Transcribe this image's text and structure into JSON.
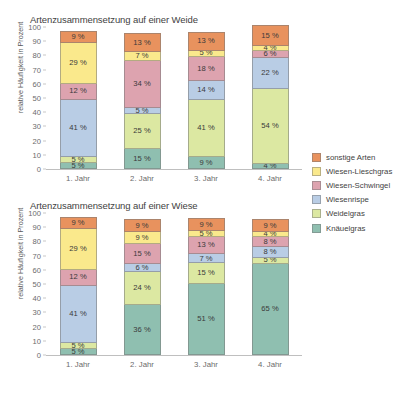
{
  "legend": {
    "position": "right",
    "items": [
      {
        "label": "sonstige Arten",
        "color": "#E8925E"
      },
      {
        "label": "Wiesen-Lieschgras",
        "color": "#FAE98C"
      },
      {
        "label": "Wiesen-Schwingel",
        "color": "#DDA3AF"
      },
      {
        "label": "Wiesenrispe",
        "color": "#B9CDE5"
      },
      {
        "label": "Weidelgras",
        "color": "#DCE8A2"
      },
      {
        "label": "Knäuelgras",
        "color": "#8FBFB0"
      }
    ]
  },
  "axis": {
    "ylabel": "relative Häufigkeit in Prozent",
    "yticks": [
      0,
      10,
      20,
      30,
      40,
      50,
      60,
      70,
      80,
      90,
      100
    ],
    "ylim": [
      0,
      100
    ],
    "categories": [
      "1. Jahr",
      "2. Jahr",
      "3. Jahr",
      "4. Jahr"
    ]
  },
  "chart_data": [
    {
      "type": "bar",
      "stacked": true,
      "title": "Artenzusammensetzung auf einer Weide",
      "xlabel": "",
      "ylabel": "relative Häufigkeit in Prozent",
      "ylim": [
        0,
        100
      ],
      "grid": false,
      "legend_position": "right",
      "categories": [
        "1. Jahr",
        "2. Jahr",
        "3. Jahr",
        "4. Jahr"
      ],
      "series": [
        {
          "name": "Knäuelgras",
          "color": "#8FBFB0",
          "values": [
            5,
            15,
            9,
            4
          ],
          "labels": [
            "5 %",
            "15 %",
            "9 %",
            "4 %"
          ]
        },
        {
          "name": "Weidelgras",
          "color": "#DCE8A2",
          "values": [
            5,
            25,
            41,
            54
          ],
          "labels": [
            "5 %",
            "25 %",
            "41 %",
            "54 %"
          ]
        },
        {
          "name": "Wiesenrispe",
          "color": "#B9CDE5",
          "values": [
            41,
            5,
            14,
            22
          ],
          "labels": [
            "41 %",
            "5 %",
            "14 %",
            "22 %"
          ]
        },
        {
          "name": "Wiesen-Schwingel",
          "color": "#DDA3AF",
          "values": [
            12,
            34,
            18,
            6
          ],
          "labels": [
            "12 %",
            "34 %",
            "18 %",
            "6 %"
          ]
        },
        {
          "name": "Wiesen-Lieschgras",
          "color": "#FAE98C",
          "values": [
            29,
            7,
            5,
            4
          ],
          "labels": [
            "29 %",
            "7 %",
            "5 %",
            "4 %"
          ]
        },
        {
          "name": "sonstige Arten",
          "color": "#E8925E",
          "values": [
            9,
            13,
            13,
            15
          ],
          "labels": [
            "9 %",
            "13 %",
            "13 %",
            "15 %"
          ]
        }
      ]
    },
    {
      "type": "bar",
      "stacked": true,
      "title": "Artenzusammensetzung auf einer Wiese",
      "xlabel": "",
      "ylabel": "relative Häufigkeit in Prozent",
      "ylim": [
        0,
        100
      ],
      "grid": false,
      "legend_position": "right",
      "categories": [
        "1. Jahr",
        "2. Jahr",
        "3. Jahr",
        "4. Jahr"
      ],
      "series": [
        {
          "name": "Knäuelgras",
          "color": "#8FBFB0",
          "values": [
            5,
            36,
            51,
            65
          ],
          "labels": [
            "5 %",
            "36 %",
            "51 %",
            "65 %"
          ]
        },
        {
          "name": "Weidelgras",
          "color": "#DCE8A2",
          "values": [
            5,
            24,
            15,
            5
          ],
          "labels": [
            "5 %",
            "24 %",
            "15 %",
            "5 %"
          ]
        },
        {
          "name": "Wiesenrispe",
          "color": "#B9CDE5",
          "values": [
            41,
            6,
            7,
            8
          ],
          "labels": [
            "41 %",
            "6 %",
            "7 %",
            "8 %"
          ]
        },
        {
          "name": "Wiesen-Schwingel",
          "color": "#DDA3AF",
          "values": [
            12,
            15,
            13,
            8
          ],
          "labels": [
            "12 %",
            "15 %",
            "13 %",
            "8 %"
          ]
        },
        {
          "name": "Wiesen-Lieschgras",
          "color": "#FAE98C",
          "values": [
            29,
            9,
            5,
            4
          ],
          "labels": [
            "29 %",
            "9 %",
            "5 %",
            "4 %"
          ]
        },
        {
          "name": "sonstige Arten",
          "color": "#E8925E",
          "values": [
            9,
            9,
            9,
            9
          ],
          "labels": [
            "9 %",
            "9 %",
            "9 %",
            "9 %"
          ]
        }
      ]
    }
  ]
}
